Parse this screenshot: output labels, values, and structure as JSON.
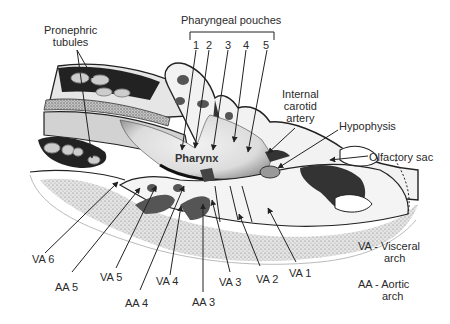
{
  "figure": {
    "center_label": "Pharynx",
    "labels": {
      "pronephric": [
        "Pronephric",
        "tubules"
      ],
      "pharyngeal_pouches": "Pharyngeal pouches",
      "pouch_numbers": [
        "1",
        "2",
        "3",
        "4",
        "5"
      ],
      "internal_carotid": [
        "Internal",
        "carotid",
        "artery"
      ],
      "hypophysis": "Hypophysis",
      "olfactory_sac": "Olfactory sac",
      "arches": [
        {
          "id": "VA6",
          "text": "VA 6"
        },
        {
          "id": "AA5",
          "text": "AA 5"
        },
        {
          "id": "VA5",
          "text": "VA 5"
        },
        {
          "id": "AA4",
          "text": "AA 4"
        },
        {
          "id": "VA4",
          "text": "VA 4"
        },
        {
          "id": "AA3",
          "text": "AA 3"
        },
        {
          "id": "VA3",
          "text": "VA 3"
        },
        {
          "id": "VA2",
          "text": "VA 2"
        },
        {
          "id": "VA1",
          "text": "VA 1"
        }
      ]
    },
    "legend": [
      {
        "abbr": "VA - Visceral",
        "cont": "arch"
      },
      {
        "abbr": "AA - Aortic",
        "cont": "arch"
      }
    ],
    "colors": {
      "line": "#2b2b2b",
      "dark": "#3a3a3a",
      "mid": "#6e6e6e",
      "light": "#cfcfcf",
      "pale": "#ececec",
      "stipple": "#9a9a9a"
    }
  }
}
